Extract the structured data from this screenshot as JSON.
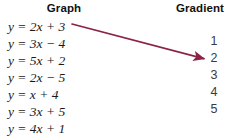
{
  "headers": {
    "graph": "Graph",
    "gradient": "Gradient"
  },
  "graph_column": {
    "items": [
      {
        "lhs": "y",
        "eq": "=",
        "coef": "2",
        "x": "x",
        "sign": "+",
        "const": "3",
        "full": "y = 2x + 3"
      },
      {
        "lhs": "y",
        "eq": "=",
        "coef": "3",
        "x": "x",
        "sign": "−",
        "const": "4",
        "full": "y = 3x − 4"
      },
      {
        "lhs": "y",
        "eq": "=",
        "coef": "5",
        "x": "x",
        "sign": "+",
        "const": "2",
        "full": "y = 5x + 2"
      },
      {
        "lhs": "y",
        "eq": "=",
        "coef": "2",
        "x": "x",
        "sign": "−",
        "const": "5",
        "full": "y = 2x − 5"
      },
      {
        "lhs": "y",
        "eq": "=",
        "coef": "",
        "x": "x",
        "sign": "+",
        "const": "4",
        "full": "y = x + 4"
      },
      {
        "lhs": "y",
        "eq": "=",
        "coef": "3",
        "x": "x",
        "sign": "+",
        "const": "5",
        "full": "y = 3x + 5"
      },
      {
        "lhs": "y",
        "eq": "=",
        "coef": "4",
        "x": "x",
        "sign": "+",
        "const": "1",
        "full": "y = 4x + 1"
      }
    ]
  },
  "gradient_column": {
    "items": [
      "1",
      "2",
      "3",
      "4",
      "5"
    ]
  },
  "annotation": {
    "arrow": {
      "from_label": "y = 2x + 3",
      "to_label": "2",
      "color": "#8B2347",
      "x1": 72,
      "y1": 24,
      "x2": 205,
      "y2": 59
    }
  },
  "colors": {
    "background": "#ffffff",
    "header_text": "#111111",
    "equation_text": "#1a1a1a",
    "gradient_text": "#3b3b3b",
    "arrow": "#8B2347"
  }
}
